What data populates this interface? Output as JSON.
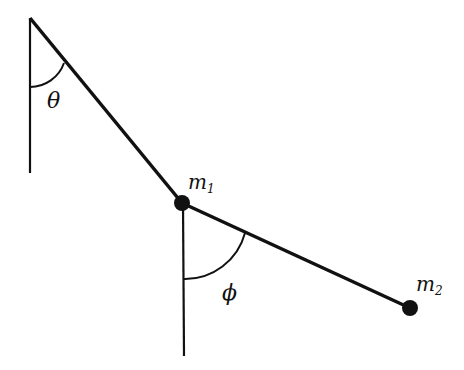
{
  "diagram": {
    "type": "double pendulum",
    "labels": {
      "theta": "θ",
      "phi": "ϕ",
      "m1_base": "m",
      "m1_sub": "1",
      "m2_base": "m",
      "m2_sub": "2"
    },
    "colors": {
      "stroke": "#111111",
      "background": "#ffffff"
    },
    "points": {
      "pivot": [
        30,
        18
      ],
      "m1": [
        182,
        203
      ],
      "m2": [
        410,
        308
      ]
    }
  }
}
